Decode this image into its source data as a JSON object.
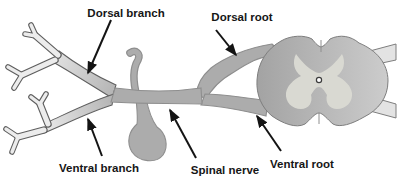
{
  "diagram": {
    "labels": {
      "dorsal_branch": "Dorsal branch",
      "dorsal_root": "Dorsal root",
      "ventral_branch": "Ventral branch",
      "spinal_nerve": "Spinal nerve",
      "ventral_root": "Ventral root"
    },
    "colors": {
      "background": "#ffffff",
      "text": "#161616",
      "arrow": "#141414",
      "nerve_fill": "#acacac",
      "nerve_outline": "#8e8e8e",
      "cord_fill_dark": "#a3a3a3",
      "cord_fill_light": "#cccccc",
      "cord_outline": "#7e7e7e",
      "gray_matter": "#d9d9d2",
      "central_canal_fill": "#ffffff",
      "central_canal_outline": "#3c3c3c",
      "branch_fill_light": "#ececec",
      "branch_fill_gray": "#b2b2b2",
      "branch_outline": "#5f5f5f",
      "stub_fill": "#e3e3e3"
    }
  }
}
